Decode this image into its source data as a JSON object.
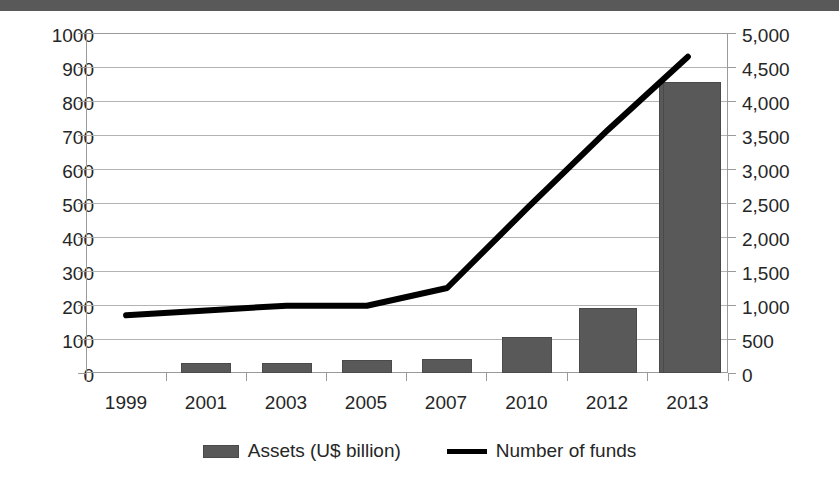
{
  "chart_data": {
    "type": "bar",
    "title": "",
    "subtitle": "",
    "xlabel": "",
    "ylabel": "",
    "y2label": "",
    "grid": true,
    "legend_position": "bottom",
    "categories": [
      "1999",
      "2001",
      "2003",
      "2005",
      "2007",
      "2010",
      "2012",
      "2013"
    ],
    "ylim": [
      0,
      1000
    ],
    "y2lim": [
      0,
      5000
    ],
    "yticks": [
      "0",
      "100",
      "200",
      "300",
      "400",
      "500",
      "600",
      "700",
      "800",
      "900",
      "1000"
    ],
    "y2ticks": [
      "0",
      "500",
      "1,000",
      "1,500",
      "2,000",
      "2,500",
      "3,000",
      "3,500",
      "4,000",
      "4,500",
      "5,000"
    ],
    "series": [
      {
        "name": "Assets (U$ billion)",
        "type": "bar",
        "axis": "left",
        "color": "#595959",
        "values": [
          32,
          28,
          30,
          38,
          40,
          105,
          190,
          855
        ]
      },
      {
        "name": "Number of funds",
        "type": "line",
        "axis": "right",
        "color": "#000000",
        "values": [
          850,
          920,
          990,
          990,
          1250,
          2430,
          3570,
          4650
        ]
      }
    ]
  },
  "legend": {
    "items": [
      {
        "label": "Assets (U$ billion)",
        "marker": "bar-swatch",
        "color": "#595959"
      },
      {
        "label": "Number of funds",
        "marker": "line-swatch",
        "color": "#000000"
      }
    ]
  }
}
